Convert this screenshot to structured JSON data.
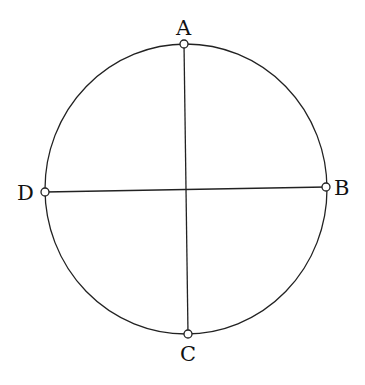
{
  "diagram": {
    "type": "circle-with-perpendicular-diameters",
    "circle": {
      "cx": 186,
      "cy": 189,
      "rx": 141,
      "ry": 145
    },
    "points": [
      {
        "label": "A",
        "x": 184,
        "y": 44,
        "label_x": 176,
        "label_y": 18
      },
      {
        "label": "B",
        "x": 326,
        "y": 187,
        "label_x": 334,
        "label_y": 179
      },
      {
        "label": "C",
        "x": 188,
        "y": 334,
        "label_x": 180,
        "label_y": 344
      },
      {
        "label": "D",
        "x": 45,
        "y": 192,
        "label_x": 17,
        "label_y": 183
      }
    ],
    "segments": [
      {
        "from": "A",
        "to": "C"
      },
      {
        "from": "D",
        "to": "B"
      }
    ],
    "stroke_color": "#222222",
    "background": "#ffffff"
  }
}
